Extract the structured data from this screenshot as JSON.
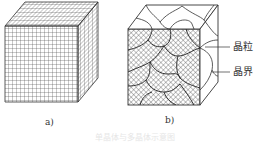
{
  "figure": {
    "panels": [
      {
        "id": "a",
        "label": "a)",
        "description": "single crystal cube with uniform grid lattice"
      },
      {
        "id": "b",
        "label": "b)",
        "description": "polycrystal cube with grains and grain boundaries"
      }
    ],
    "annotations": {
      "grain": "晶粒",
      "grain_boundary": "晶界"
    },
    "caption": "单晶体与多晶体示意图"
  },
  "colors": {
    "line": "#333333",
    "background": "#ffffff"
  }
}
